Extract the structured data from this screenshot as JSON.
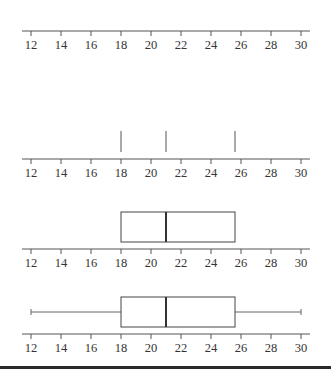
{
  "chart_data": {
    "type": "boxplot",
    "title": "",
    "xlabel": "",
    "ylabel": "",
    "xlim": [
      12,
      30
    ],
    "ticks": [
      12,
      14,
      16,
      18,
      20,
      22,
      24,
      26,
      28,
      30
    ],
    "tick_labels": [
      "12",
      "14",
      "16",
      "18",
      "20",
      "22",
      "24",
      "26",
      "28",
      "30"
    ],
    "grid": false,
    "five_number_summary": {
      "min": 12,
      "q1": 18,
      "median": 21,
      "q3": 25.6,
      "max": 30
    },
    "panels": [
      {
        "step": 1,
        "content": "number line only"
      },
      {
        "step": 2,
        "content": "vertical marks at Q1, median, Q3",
        "marks": [
          18,
          21,
          25.6
        ]
      },
      {
        "step": 3,
        "content": "box from Q1 to Q3 with median line",
        "box": [
          18,
          25.6
        ],
        "median": 21
      },
      {
        "step": 4,
        "content": "complete box plot with whiskers",
        "whiskers": [
          12,
          30
        ],
        "box": [
          18,
          25.6
        ],
        "median": 21
      }
    ]
  },
  "colors": {
    "background": "#ffffff",
    "lines": "#555555",
    "text": "#333333",
    "rule": "#2a2a2a"
  }
}
